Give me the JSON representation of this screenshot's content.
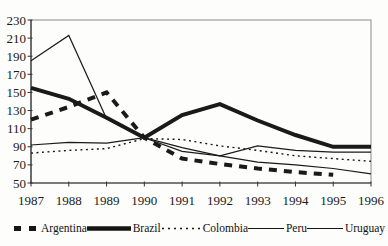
{
  "chart_data": {
    "type": "line",
    "title": "",
    "xlabel": "",
    "ylabel": "",
    "x": [
      1987,
      1988,
      1989,
      1990,
      1991,
      1992,
      1993,
      1994,
      1995,
      1996
    ],
    "ylim": [
      50,
      230
    ],
    "yticks": [
      230,
      210,
      190,
      170,
      150,
      130,
      110,
      90,
      70,
      50
    ],
    "grid": false,
    "legend_position": "bottom",
    "line_color": "#1a1a1a",
    "base_year_note": "1990 = 100",
    "series": [
      {
        "name": "Argentina",
        "style": "thick-dashed",
        "values": [
          120,
          134,
          150,
          100,
          77,
          71,
          66,
          62,
          59,
          null
        ]
      },
      {
        "name": "Brazil",
        "style": "thick-solid",
        "values": [
          155,
          143,
          122,
          100,
          125,
          137,
          119,
          103,
          90,
          90
        ]
      },
      {
        "name": "Colombia",
        "style": "dotted",
        "values": [
          83,
          86,
          88,
          99,
          98,
          91,
          86,
          80,
          77,
          74
        ]
      },
      {
        "name": "Peru",
        "style": "thin-solid",
        "values": [
          185,
          213,
          121,
          100,
          85,
          80,
          91,
          86,
          84,
          84
        ]
      },
      {
        "name": "Uruguay",
        "style": "thin-solid",
        "values": [
          92,
          95,
          94,
          100,
          89,
          80,
          73,
          70,
          66,
          60
        ]
      }
    ]
  }
}
